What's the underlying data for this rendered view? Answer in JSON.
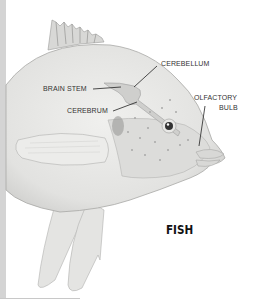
{
  "diagram": {
    "title": "FISH",
    "labels": {
      "cerebellum": "CEREBELLUM",
      "brain_stem": "BRAIN STEM",
      "cerebrum": "CEREBRUM",
      "olfactory_line1": "OLFACTORY",
      "olfactory_line2": "BULB"
    },
    "colors": {
      "body": "#e6e6e4",
      "shadow": "#c9c9c7",
      "outline": "#a8a8a6",
      "label_text": "#333333",
      "leader_line": "#222222"
    }
  }
}
